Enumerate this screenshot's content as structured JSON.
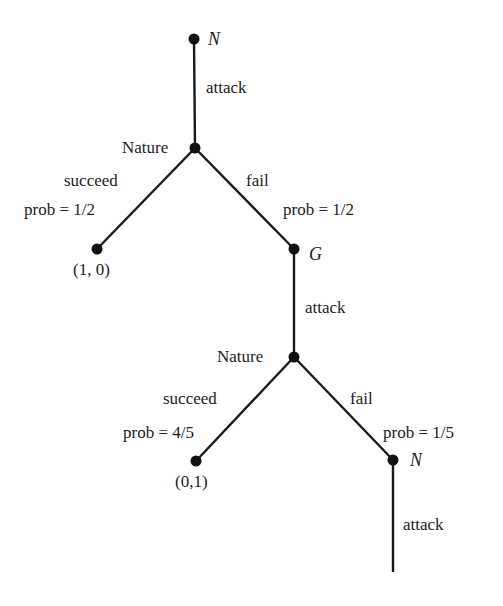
{
  "diagram": {
    "type": "game-tree",
    "nodes": [
      {
        "id": "n1",
        "label": "N",
        "x": 194,
        "y": 39,
        "kind": "player"
      },
      {
        "id": "nature1",
        "label": "Nature",
        "x": 195,
        "y": 148,
        "kind": "chance"
      },
      {
        "id": "leaf1",
        "label": "(1, 0)",
        "x": 97,
        "y": 249,
        "kind": "terminal"
      },
      {
        "id": "g",
        "label": "G",
        "x": 294,
        "y": 249,
        "kind": "player"
      },
      {
        "id": "nature2",
        "label": "Nature",
        "x": 294,
        "y": 357,
        "kind": "chance"
      },
      {
        "id": "leaf2",
        "label": "(0,1)",
        "x": 196,
        "y": 461,
        "kind": "terminal"
      },
      {
        "id": "n2",
        "label": "N",
        "x": 393,
        "y": 460,
        "kind": "player"
      }
    ],
    "edges": [
      {
        "from": "n1",
        "to": "nature1",
        "action": "attack"
      },
      {
        "from": "nature1",
        "to": "leaf1",
        "action": "succeed",
        "prob": "prob = 1/2"
      },
      {
        "from": "nature1",
        "to": "g",
        "action": "fail",
        "prob": "prob = 1/2"
      },
      {
        "from": "g",
        "to": "nature2",
        "action": "attack"
      },
      {
        "from": "nature2",
        "to": "leaf2",
        "action": "succeed",
        "prob": "prob = 4/5"
      },
      {
        "from": "nature2",
        "to": "n2",
        "action": "fail",
        "prob": "prob = 1/5"
      },
      {
        "from": "n2",
        "to": "continuation",
        "action": "attack"
      }
    ],
    "labels": {
      "top_player": "N",
      "attack_1": "attack",
      "nature_1": "Nature",
      "succeed_1": "succeed",
      "prob_succeed_1": "prob = 1/2",
      "fail_1": "fail",
      "prob_fail_1": "prob = 1/2",
      "payoff_1": "(1, 0)",
      "player_g": "G",
      "attack_2": "attack",
      "nature_2": "Nature",
      "succeed_2": "succeed",
      "prob_succeed_2": "prob = 4/5",
      "fail_2": "fail",
      "prob_fail_2": "prob = 1/5",
      "payoff_2": "(0,1)",
      "bottom_player": "N",
      "attack_3": "attack"
    }
  }
}
